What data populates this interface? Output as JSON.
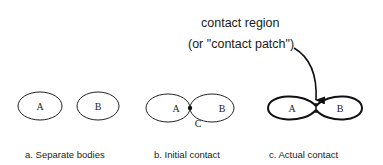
{
  "annotation": {
    "line1": "contact region",
    "line2": "(or \"contact patch\")"
  },
  "panels": [
    {
      "id": "a",
      "caption": "a.  Separate bodies",
      "body_a": "A",
      "body_b": "B"
    },
    {
      "id": "b",
      "caption": "b.  Initial contact",
      "body_a": "A",
      "body_b": "B",
      "contact_point": "C"
    },
    {
      "id": "c",
      "caption": "c.  Actual contact",
      "body_a": "A",
      "body_b": "B"
    }
  ]
}
